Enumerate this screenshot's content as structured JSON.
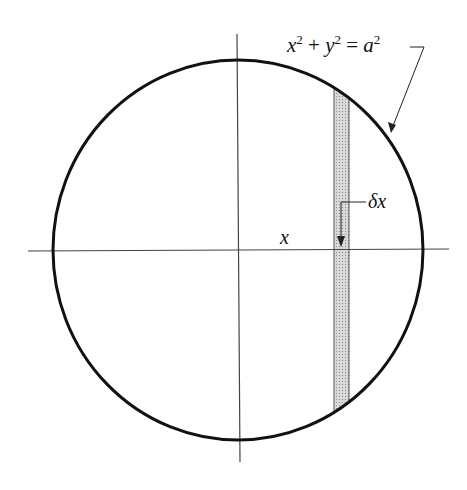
{
  "diagram": {
    "equation_label": {
      "parts": [
        "x",
        "2",
        " + ",
        "y",
        "2",
        " = ",
        "a",
        "2"
      ],
      "text": "x² + y² = a²"
    },
    "x_label": "x",
    "strip_label": "δx",
    "colors": {
      "circle": "#111111",
      "axes": "#444444",
      "strip_fill": "#cfcfcf",
      "background": "#ffffff"
    },
    "geometry": {
      "center": [
        238,
        250
      ],
      "rx": 185,
      "ry": 190,
      "strip_x": [
        334,
        349
      ]
    }
  }
}
